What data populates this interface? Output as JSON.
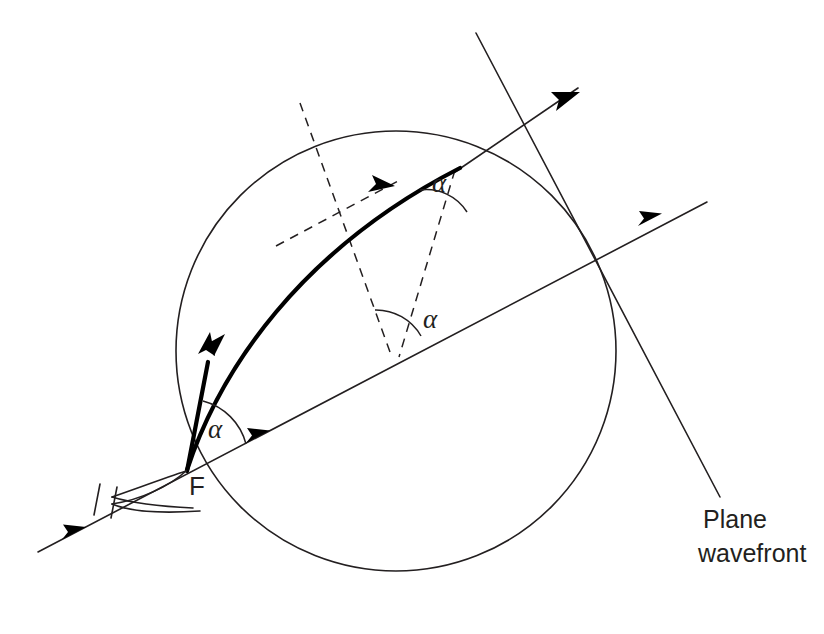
{
  "figure": {
    "background_color": "#ffffff",
    "ink_color": "#231f20",
    "width": 824,
    "height": 634
  },
  "labels": {
    "focus": "F",
    "angle_top": "α",
    "angle_middle": "α",
    "angle_bottom": "α",
    "wavefront_line1": "Plane",
    "wavefront_line2": "wavefront"
  },
  "geometry": {
    "circle": {
      "cx": 396,
      "cy": 351,
      "r": 220
    },
    "focus_point": {
      "x": 186,
      "y": 472
    },
    "incident_ray": {
      "x1": 38,
      "y1": 552,
      "x2": 707,
      "y2": 202
    },
    "wavefront_line": {
      "x1": 476,
      "y1": 33,
      "x2": 720,
      "y2": 497
    },
    "exit_ray": {
      "x1": 186,
      "y1": 472,
      "x2": 600,
      "y2": 85
    }
  },
  "annotations": {
    "angle_count": 3,
    "arrow_count": 6,
    "tick_count": 2
  }
}
